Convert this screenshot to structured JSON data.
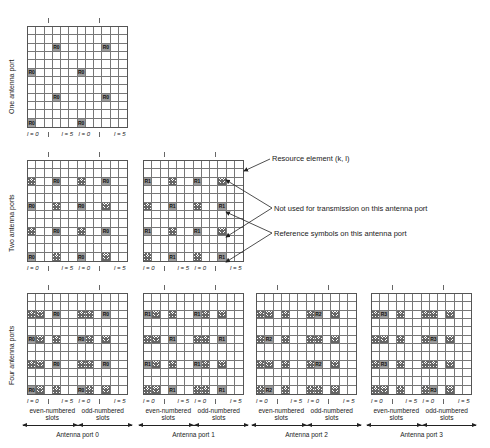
{
  "rows": {
    "one": {
      "label": "One antenna port"
    },
    "two": {
      "label": "Two antenna ports"
    },
    "four": {
      "label": "Four antenna ports"
    }
  },
  "axis": {
    "l0": "l = 0",
    "l5": "l = 5"
  },
  "slots": {
    "even": "even-numbered\nslots",
    "odd": "odd-numbered\nslots"
  },
  "ports": [
    "Antenna port 0",
    "Antenna port 1",
    "Antenna port 2",
    "Antenna port 3"
  ],
  "legend": {
    "resource_element": "Resource element (k, l)",
    "not_used": "Not used for transmission on this antenna port",
    "reference": "Reference symbols on this antenna port"
  },
  "grids": [
    {
      "id": "one-p0",
      "x": 27,
      "y": 26,
      "ref": "R0",
      "cells": [
        [
          2,
          3,
          "R"
        ],
        [
          2,
          9,
          "R"
        ],
        [
          5,
          0,
          "R"
        ],
        [
          5,
          6,
          "R"
        ],
        [
          8,
          3,
          "R"
        ],
        [
          8,
          9,
          "R"
        ],
        [
          11,
          0,
          "R"
        ],
        [
          11,
          6,
          "R"
        ]
      ]
    },
    {
      "id": "two-p0",
      "x": 27,
      "y": 160,
      "ref": "R0",
      "cells": [
        [
          2,
          0,
          "H"
        ],
        [
          2,
          3,
          "R"
        ],
        [
          2,
          6,
          "H"
        ],
        [
          2,
          9,
          "R"
        ],
        [
          5,
          0,
          "R"
        ],
        [
          5,
          3,
          "H"
        ],
        [
          5,
          6,
          "R"
        ],
        [
          5,
          9,
          "H"
        ],
        [
          8,
          0,
          "H"
        ],
        [
          8,
          3,
          "R"
        ],
        [
          8,
          6,
          "H"
        ],
        [
          8,
          9,
          "R"
        ],
        [
          11,
          0,
          "R"
        ],
        [
          11,
          3,
          "H"
        ],
        [
          11,
          6,
          "R"
        ],
        [
          11,
          9,
          "H"
        ]
      ]
    },
    {
      "id": "two-p1",
      "x": 143,
      "y": 160,
      "ref": "R1",
      "cells": [
        [
          2,
          0,
          "R"
        ],
        [
          2,
          3,
          "H"
        ],
        [
          2,
          6,
          "R"
        ],
        [
          2,
          9,
          "H"
        ],
        [
          5,
          0,
          "H"
        ],
        [
          5,
          3,
          "R"
        ],
        [
          5,
          6,
          "H"
        ],
        [
          5,
          9,
          "R"
        ],
        [
          8,
          0,
          "R"
        ],
        [
          8,
          3,
          "H"
        ],
        [
          8,
          6,
          "R"
        ],
        [
          8,
          9,
          "H"
        ],
        [
          11,
          0,
          "H"
        ],
        [
          11,
          3,
          "R"
        ],
        [
          11,
          6,
          "H"
        ],
        [
          11,
          9,
          "R"
        ]
      ]
    },
    {
      "id": "four-p0",
      "x": 27,
      "y": 293,
      "ref": "R0",
      "cells": [
        [
          2,
          0,
          "H"
        ],
        [
          2,
          1,
          "H"
        ],
        [
          2,
          3,
          "R"
        ],
        [
          2,
          6,
          "H"
        ],
        [
          2,
          7,
          "H"
        ],
        [
          2,
          9,
          "R"
        ],
        [
          5,
          0,
          "R"
        ],
        [
          5,
          1,
          "H"
        ],
        [
          5,
          3,
          "H"
        ],
        [
          5,
          6,
          "R"
        ],
        [
          5,
          7,
          "H"
        ],
        [
          5,
          9,
          "H"
        ],
        [
          8,
          0,
          "H"
        ],
        [
          8,
          1,
          "H"
        ],
        [
          8,
          3,
          "R"
        ],
        [
          8,
          6,
          "H"
        ],
        [
          8,
          7,
          "H"
        ],
        [
          8,
          9,
          "R"
        ],
        [
          11,
          0,
          "R"
        ],
        [
          11,
          1,
          "H"
        ],
        [
          11,
          3,
          "H"
        ],
        [
          11,
          6,
          "R"
        ],
        [
          11,
          7,
          "H"
        ],
        [
          11,
          9,
          "H"
        ]
      ]
    },
    {
      "id": "four-p1",
      "x": 143,
      "y": 293,
      "ref": "R1",
      "cells": [
        [
          2,
          0,
          "R"
        ],
        [
          2,
          1,
          "H"
        ],
        [
          2,
          3,
          "H"
        ],
        [
          2,
          6,
          "R"
        ],
        [
          2,
          7,
          "H"
        ],
        [
          2,
          9,
          "H"
        ],
        [
          5,
          0,
          "H"
        ],
        [
          5,
          1,
          "H"
        ],
        [
          5,
          3,
          "R"
        ],
        [
          5,
          6,
          "H"
        ],
        [
          5,
          7,
          "H"
        ],
        [
          5,
          9,
          "R"
        ],
        [
          8,
          0,
          "R"
        ],
        [
          8,
          1,
          "H"
        ],
        [
          8,
          3,
          "H"
        ],
        [
          8,
          6,
          "R"
        ],
        [
          8,
          7,
          "H"
        ],
        [
          8,
          9,
          "H"
        ],
        [
          11,
          0,
          "H"
        ],
        [
          11,
          1,
          "H"
        ],
        [
          11,
          3,
          "R"
        ],
        [
          11,
          6,
          "H"
        ],
        [
          11,
          7,
          "H"
        ],
        [
          11,
          9,
          "R"
        ]
      ]
    },
    {
      "id": "four-p2",
      "x": 256,
      "y": 293,
      "ref": "R2",
      "cells": [
        [
          2,
          0,
          "H"
        ],
        [
          2,
          1,
          "H"
        ],
        [
          2,
          3,
          "H"
        ],
        [
          2,
          6,
          "H"
        ],
        [
          2,
          7,
          "R"
        ],
        [
          2,
          9,
          "H"
        ],
        [
          5,
          0,
          "H"
        ],
        [
          5,
          1,
          "R"
        ],
        [
          5,
          3,
          "H"
        ],
        [
          5,
          6,
          "H"
        ],
        [
          5,
          7,
          "H"
        ],
        [
          5,
          9,
          "H"
        ],
        [
          8,
          0,
          "H"
        ],
        [
          8,
          1,
          "H"
        ],
        [
          8,
          3,
          "H"
        ],
        [
          8,
          6,
          "H"
        ],
        [
          8,
          7,
          "R"
        ],
        [
          8,
          9,
          "H"
        ],
        [
          11,
          0,
          "H"
        ],
        [
          11,
          1,
          "R"
        ],
        [
          11,
          3,
          "H"
        ],
        [
          11,
          6,
          "H"
        ],
        [
          11,
          7,
          "H"
        ],
        [
          11,
          9,
          "H"
        ]
      ]
    },
    {
      "id": "four-p3",
      "x": 371,
      "y": 293,
      "ref": "R3",
      "cells": [
        [
          2,
          0,
          "H"
        ],
        [
          2,
          1,
          "R"
        ],
        [
          2,
          3,
          "H"
        ],
        [
          2,
          6,
          "H"
        ],
        [
          2,
          7,
          "H"
        ],
        [
          2,
          9,
          "H"
        ],
        [
          5,
          0,
          "H"
        ],
        [
          5,
          1,
          "H"
        ],
        [
          5,
          3,
          "H"
        ],
        [
          5,
          6,
          "H"
        ],
        [
          5,
          7,
          "R"
        ],
        [
          5,
          9,
          "H"
        ],
        [
          8,
          0,
          "H"
        ],
        [
          8,
          1,
          "R"
        ],
        [
          8,
          3,
          "H"
        ],
        [
          8,
          6,
          "H"
        ],
        [
          8,
          7,
          "H"
        ],
        [
          8,
          9,
          "H"
        ],
        [
          11,
          0,
          "H"
        ],
        [
          11,
          1,
          "H"
        ],
        [
          11,
          3,
          "H"
        ],
        [
          11,
          6,
          "H"
        ],
        [
          11,
          7,
          "R"
        ],
        [
          11,
          9,
          "H"
        ]
      ]
    }
  ]
}
